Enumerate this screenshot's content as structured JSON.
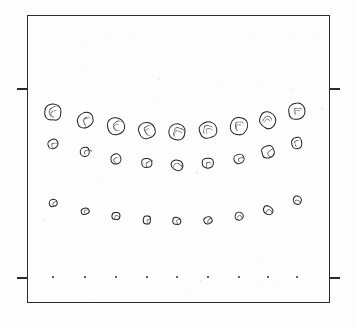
{
  "figure": {
    "background_color": "#fdfdfd",
    "ink_color": "#1e1e1e"
  },
  "frame": {
    "name": "plot-frame",
    "x": 27,
    "y": 15,
    "width": 303,
    "height": 288,
    "border_color": "#2b2b2b",
    "border_width": 1.3
  },
  "ticks": [
    {
      "name": "tick-left-upper",
      "side": "left",
      "x": 17,
      "y": 88,
      "length": 11
    },
    {
      "name": "tick-right-upper",
      "side": "right",
      "x": 329,
      "y": 88,
      "length": 11
    },
    {
      "name": "tick-left-lower",
      "side": "left",
      "x": 17,
      "y": 277,
      "length": 11
    },
    {
      "name": "tick-right-lower",
      "side": "right",
      "x": 329,
      "y": 277,
      "length": 11
    }
  ],
  "chart_data": {
    "type": "scatter",
    "title": "",
    "xlabel": "",
    "ylabel": "",
    "xlim": [
      27,
      330
    ],
    "ylim": [
      15,
      303
    ],
    "grid": false,
    "legend": null,
    "note": "Marker sizes encode particle diameter; each row is one size class drawn as a shallow U (catenary) curve across the frame.",
    "x": [
      53,
      85,
      116,
      147,
      177,
      208,
      239,
      268,
      297
    ],
    "series": [
      {
        "name": "row-1-large-particles",
        "marker": "irregular-circle",
        "values": [
          112,
          120,
          126,
          130,
          132,
          130,
          126,
          120,
          111
        ],
        "sizes": [
          17,
          17,
          18,
          18,
          18,
          17,
          18,
          18,
          18
        ]
      },
      {
        "name": "row-2-medium-particles",
        "marker": "irregular-circle",
        "values": [
          144,
          152,
          159,
          163,
          165,
          163,
          159,
          152,
          143
        ],
        "sizes": [
          11,
          11,
          12,
          11,
          12,
          12,
          11,
          13,
          12
        ]
      },
      {
        "name": "row-3-small-particles",
        "marker": "irregular-circle",
        "values": [
          203,
          211,
          216,
          220,
          221,
          220,
          216,
          210,
          200
        ],
        "sizes": [
          9,
          8,
          9,
          9,
          9,
          9,
          9,
          10,
          9
        ]
      },
      {
        "name": "row-4-dots",
        "marker": "dot",
        "values": [
          277,
          277,
          277,
          277,
          277,
          277,
          277,
          277,
          277
        ],
        "sizes": [
          2,
          2,
          2,
          2,
          2,
          2,
          2,
          2,
          2
        ]
      }
    ]
  }
}
